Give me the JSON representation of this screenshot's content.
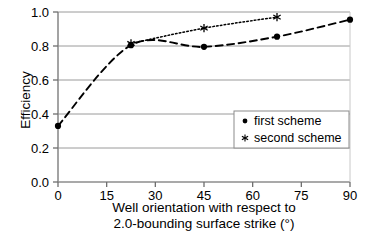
{
  "chart_data": {
    "type": "line",
    "title": "",
    "xlabel": "Well orientation with respect to 2.0-bounding surface strike (°)",
    "xlabel_line1": "Well orientation with respect to",
    "xlabel_line2": "2.0-bounding surface strike (°)",
    "ylabel": "Efficiency",
    "xlim": [
      0,
      90
    ],
    "ylim": [
      0.0,
      1.0
    ],
    "xticks": [
      0,
      15,
      30,
      45,
      60,
      75,
      90
    ],
    "xtick_labels": [
      "0",
      "15",
      "30",
      "45",
      "60",
      "75",
      "90"
    ],
    "yticks": [
      0.0,
      0.2,
      0.4,
      0.6,
      0.8,
      1.0
    ],
    "ytick_labels": [
      "0.0",
      "0.2",
      "0.4",
      "0.6",
      "0.8",
      "1.0"
    ],
    "grid": "horizontal",
    "legend_position": "lower-right",
    "series": [
      {
        "name": "first scheme",
        "marker": "circle",
        "linestyle": "dashed",
        "color": "#000000",
        "x": [
          0,
          22.5,
          45,
          67.5,
          90
        ],
        "values": [
          0.33,
          0.805,
          0.795,
          0.855,
          0.955
        ]
      },
      {
        "name": "second scheme",
        "marker": "asterisk",
        "linestyle": "dotted",
        "color": "#000000",
        "x": [
          22.5,
          45,
          67.5
        ],
        "values": [
          0.815,
          0.905,
          0.97
        ]
      }
    ]
  },
  "legend": {
    "entries": [
      {
        "label": "first scheme",
        "marker": "circle"
      },
      {
        "label": "second scheme",
        "marker": "asterisk"
      }
    ]
  },
  "colors": {
    "axis": "#000000",
    "grid": "#9a9a9a",
    "series": "#000000",
    "background": "#ffffff"
  }
}
